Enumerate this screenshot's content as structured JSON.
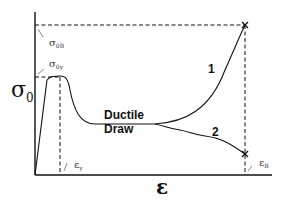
{
  "diagram": {
    "type": "stress-strain curve",
    "y_axis_label": {
      "symbol": "σ",
      "subscript": "0"
    },
    "x_axis_label": "ε",
    "annotations": {
      "sigma_break": {
        "symbol": "σ",
        "subscript": "0B"
      },
      "sigma_yield": {
        "symbol": "σ",
        "subscript": "0y"
      },
      "eps_yield": {
        "symbol": "ε",
        "subscript": "y"
      },
      "eps_break": {
        "symbol": "ε",
        "subscript": "B"
      },
      "region_line1": "Ductile",
      "region_line2": "Draw"
    },
    "curves": [
      {
        "id": "1",
        "label": "1",
        "behavior": "strain hardening, ends at σ0B"
      },
      {
        "id": "2",
        "label": "2",
        "behavior": "strain softening, ends lower"
      }
    ],
    "colors": {
      "line": "#111111",
      "background": "#ffffff"
    }
  }
}
